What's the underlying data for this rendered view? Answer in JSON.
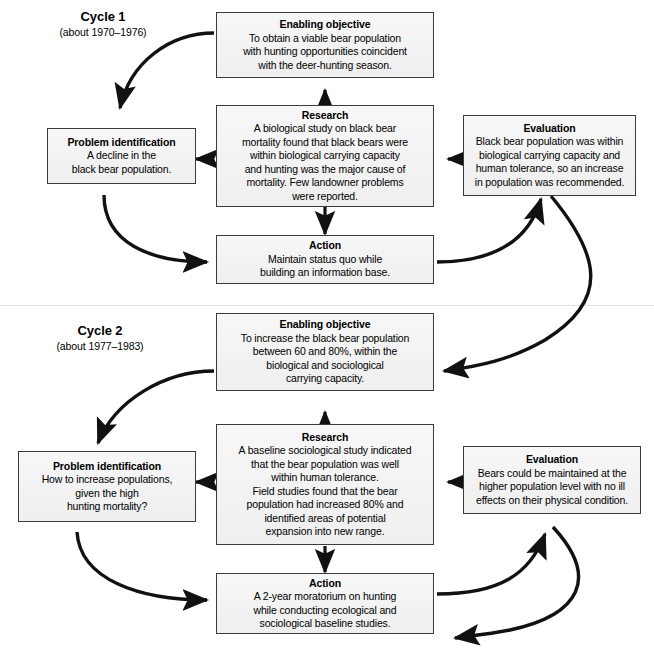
{
  "diagram": {
    "title_label": "Adaptive management cycles",
    "cycles": [
      {
        "name": "Cycle 1",
        "period": "(about 1970–1976)",
        "boxes": {
          "enabling_objective": {
            "title": "Enabling objective",
            "text": "To obtain a viable bear population\nwith hunting opportunities coincident\nwith the deer-hunting season."
          },
          "research": {
            "title": "Research",
            "text": "A biological study on black bear\nmortality found that black bears were\nwithin biological carrying capacity\nand hunting was the major cause of\nmortality. Few landowner problems\nwere reported."
          },
          "problem_identification": {
            "title": "Problem identification",
            "text": "A decline in the\nblack bear population."
          },
          "evaluation": {
            "title": "Evaluation",
            "text": "Black bear population was within\nbiological carrying capacity and\nhuman tolerance, so an increase\nin population was recommended."
          },
          "action": {
            "title": "Action",
            "text": "Maintain status quo while\nbuilding an information base."
          }
        }
      },
      {
        "name": "Cycle 2",
        "period": "(about 1977–1983)",
        "boxes": {
          "enabling_objective": {
            "title": "Enabling objective",
            "text": "To increase the black bear population\nbetween 60 and 80%, within the\nbiological and sociological\ncarrying capacity."
          },
          "research": {
            "title": "Research",
            "text": "A baseline sociological study indicated\nthat the bear population was well\nwithin human tolerance.\nField studies found that the bear\npopulation had increased 80% and\nidentified areas of potential\nexpansion into new range."
          },
          "problem_identification": {
            "title": "Problem identification",
            "text": "How to increase populations,\ngiven the high\nhunting mortality?"
          },
          "evaluation": {
            "title": "Evaluation",
            "text": "Bears could be maintained at the\nhigher population level with no ill\neffects on their physical condition."
          },
          "action": {
            "title": "Action",
            "text": "A 2-year moratorium on hunting\nwhile conducting ecological and\nsociological baseline studies."
          }
        }
      }
    ],
    "colors": {
      "box_fill": "#f4f4f4",
      "box_border": "#3b3b3b",
      "arrow": "#111111",
      "text": "#000000",
      "divider": "#e3e3e3"
    }
  }
}
